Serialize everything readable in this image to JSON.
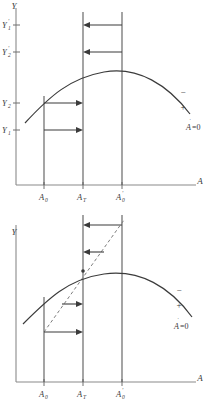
{
  "figure": {
    "title": "",
    "panels": [
      {
        "id": "top",
        "y_axis_label": "Y",
        "x_axis_label": "A",
        "y_tick_labels": [
          {
            "base": "Y",
            "sub": "1",
            "prime": "′",
            "value_y": 25
          },
          {
            "base": "Y",
            "sub": "2",
            "prime": "′",
            "value_y": 52
          },
          {
            "base": "Y",
            "sub": "2",
            "prime": "",
            "value_y": 103
          },
          {
            "base": "Y",
            "sub": "1",
            "prime": "",
            "value_y": 130
          }
        ],
        "x_tick_labels": [
          {
            "base": "A",
            "sub": "0",
            "prime": ""
          },
          {
            "base": "A",
            "sub": "T",
            "prime": ""
          },
          {
            "base": "A",
            "sub": "0",
            "prime": "′"
          }
        ],
        "curve_annotations": {
          "minus": "−",
          "plus": "+",
          "equation": "A",
          "equation_dot": "˙",
          "equation_rest": "=0"
        },
        "arrows": [
          {
            "direction": "left",
            "from_x": 122,
            "to_x": 83,
            "y": 25
          },
          {
            "direction": "left",
            "from_x": 122,
            "to_x": 83,
            "y": 52
          },
          {
            "direction": "right",
            "from_x": 44,
            "to_x": 83,
            "y": 103
          },
          {
            "direction": "right",
            "from_x": 44,
            "to_x": 83,
            "y": 130
          }
        ],
        "has_dashed_diagonal": false
      },
      {
        "id": "bottom",
        "y_axis_label": "Y",
        "x_axis_label": "A",
        "y_tick_labels": [],
        "x_tick_labels": [
          {
            "base": "A",
            "sub": "0",
            "prime": ""
          },
          {
            "base": "A",
            "sub": "T",
            "prime": ""
          },
          {
            "base": "A",
            "sub": "0",
            "prime": "′"
          }
        ],
        "curve_annotations": {
          "minus": "−",
          "plus": "+",
          "equation": "A",
          "equation_dot": "˙",
          "equation_rest": "=0"
        },
        "arrows": [
          {
            "direction": "left",
            "from_x": 122,
            "to_x": 83,
            "y": 18
          },
          {
            "direction": "left",
            "from_x": 104,
            "to_x": 83,
            "y": 45
          },
          {
            "direction": "right",
            "from_x": 62,
            "to_x": 83,
            "y": 97
          },
          {
            "direction": "right",
            "from_x": 44,
            "to_x": 83,
            "y": 125
          }
        ],
        "has_dashed_diagonal": true
      }
    ],
    "colors": {
      "curve": "#3b3b3b",
      "axis": "#8a8a8a",
      "vertical": "#5a5a5a",
      "dashed": "#7d7d7d",
      "arrow": "#3b3b3b",
      "background": "#ffffff"
    }
  }
}
